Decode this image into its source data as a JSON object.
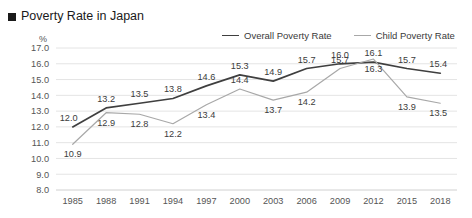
{
  "header": {
    "title": "Poverty Rate in Japan",
    "bullet_icon": "filled-square-icon"
  },
  "colors": {
    "overall_line": "#3f3f3f",
    "child_line": "#a8a8a8",
    "gridline": "#e4e4e4",
    "axis_text": "#555555",
    "title_text": "#1a1a1a",
    "background": "#ffffff"
  },
  "chart_data": {
    "type": "line",
    "title": "Poverty Rate in Japan",
    "xlabel": "",
    "ylabel": "%",
    "ylim": [
      8.0,
      17.0
    ],
    "ytick_step": 1.0,
    "yticks": [
      "17.0",
      "16.0",
      "15.0",
      "14.0",
      "13.0",
      "12.0",
      "11.0",
      "10.0",
      "9.0",
      "8.0"
    ],
    "grid": true,
    "legend_position": "top-right",
    "categories": [
      "1985",
      "1988",
      "1991",
      "1994",
      "1997",
      "2000",
      "2003",
      "2006",
      "2009",
      "2012",
      "2015",
      "2018"
    ],
    "series": [
      {
        "name": "Overall Poverty Rate",
        "color": "#3f3f3f",
        "values": [
          12.0,
          13.2,
          13.5,
          13.8,
          14.6,
          15.3,
          14.9,
          15.7,
          16.0,
          16.1,
          15.7,
          15.4
        ],
        "labels": [
          "12.0",
          "13.2",
          "13.5",
          "13.8",
          "14.6",
          "15.3",
          "14.9",
          "15.7",
          "16.0",
          "16.1",
          "15.7",
          "15.4"
        ],
        "label_side": [
          "above",
          "above",
          "above",
          "above",
          "above",
          "above",
          "above",
          "above",
          "above",
          "above",
          "above",
          "above"
        ]
      },
      {
        "name": "Child Poverty Rate",
        "color": "#a8a8a8",
        "values": [
          10.9,
          12.9,
          12.8,
          12.2,
          13.4,
          14.4,
          13.7,
          14.2,
          15.7,
          16.3,
          13.9,
          13.5
        ],
        "labels": [
          "10.9",
          "12.9",
          "12.8",
          "12.2",
          "13.4",
          "14.4",
          "13.7",
          "14.2",
          "15.7",
          "16.3",
          "13.9",
          "13.5"
        ],
        "label_side": [
          "below",
          "below",
          "below",
          "below",
          "below",
          "above",
          "below",
          "below",
          "above",
          "below",
          "below",
          "below"
        ]
      }
    ]
  },
  "legend": {
    "items": [
      {
        "label": "Overall Poverty Rate",
        "color": "#3f3f3f"
      },
      {
        "label": "Child Poverty Rate",
        "color": "#a8a8a8"
      }
    ]
  }
}
